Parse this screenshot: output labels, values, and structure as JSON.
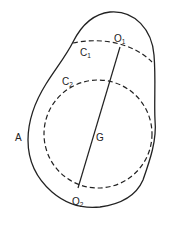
{
  "diagram": {
    "labels": {
      "outline": "A",
      "circle1": {
        "main": "C",
        "sub": "1"
      },
      "circle2": {
        "main": "C",
        "sub": "2"
      },
      "point_top": {
        "main": "O",
        "sub": "1"
      },
      "point_bottom": {
        "main": "O",
        "sub": "2"
      },
      "center": "G"
    },
    "colors": {
      "stroke": "#222222",
      "background": "#ffffff"
    }
  }
}
